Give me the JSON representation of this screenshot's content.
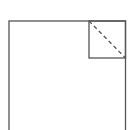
{
  "diagram": {
    "stroke_color": "#555555",
    "background": "#ffffff",
    "outer_rect": {
      "x": 9,
      "y": 21,
      "width": 116.5,
      "height": 112
    },
    "inner_square": {
      "x": 89,
      "y": 21,
      "width": 36.5,
      "height": 37
    },
    "diagonal": {
      "x1": 89,
      "y1": 21,
      "x2": 125.5,
      "y2": 58,
      "style": "dashed"
    }
  }
}
